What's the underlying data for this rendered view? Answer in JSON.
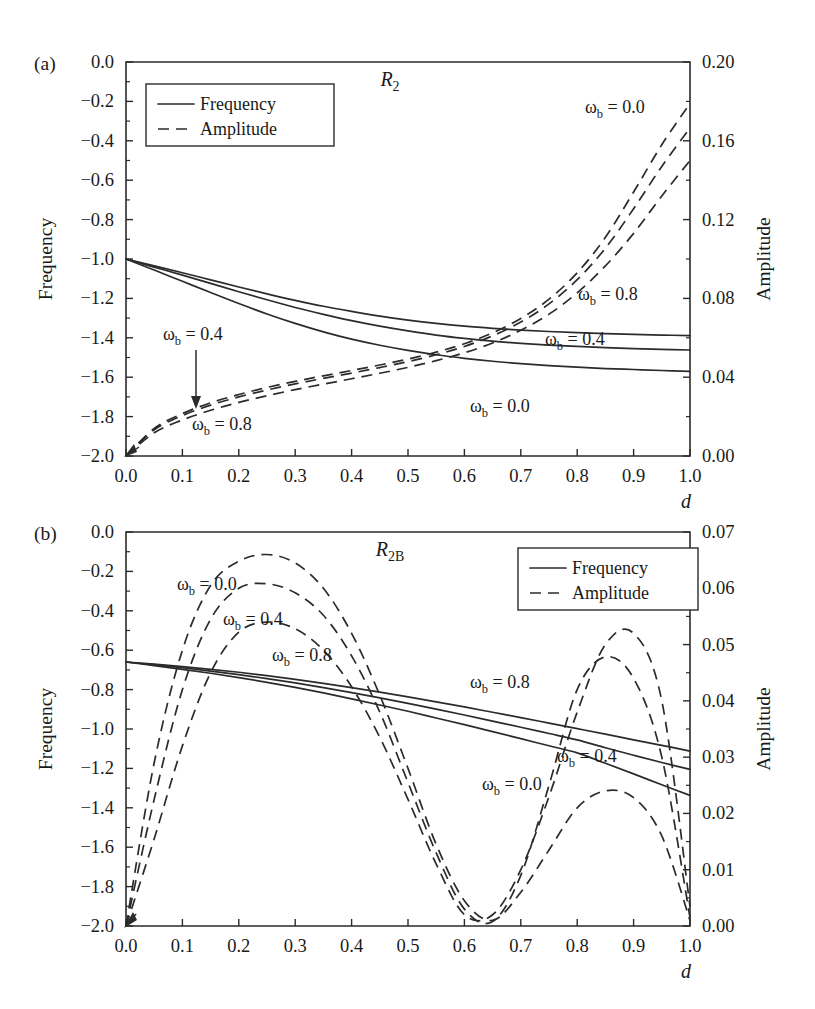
{
  "figure": {
    "panels": [
      {
        "id": "a",
        "panel_label": "(a)",
        "title_main": "R",
        "title_sub": "2",
        "xlabel": "d",
        "ylabel_left": "Frequency",
        "ylabel_right": "Amplitude",
        "legend": {
          "frequency": "Frequency",
          "amplitude": "Amplitude"
        },
        "xticks": [
          "0.0",
          "0.1",
          "0.2",
          "0.3",
          "0.4",
          "0.5",
          "0.6",
          "0.7",
          "0.8",
          "0.9",
          "1.0"
        ],
        "yticks_left": [
          "0.0",
          "-0.2",
          "-0.4",
          "-0.6",
          "-0.8",
          "-1.0",
          "-1.2",
          "-1.4",
          "-1.6",
          "-1.8",
          "-2.0"
        ],
        "yticks_right": [
          "0.20",
          "0.16",
          "0.12",
          "0.08",
          "0.04",
          "0.00"
        ],
        "annotations": [
          {
            "name": "freq-omega-08",
            "text": "ω",
            "sub": "b",
            "rest": " = 0.8"
          },
          {
            "name": "freq-omega-04",
            "text": "ω",
            "sub": "b",
            "rest": " = 0.4"
          },
          {
            "name": "freq-omega-00",
            "text": "ω",
            "sub": "b",
            "rest": " = 0.0"
          },
          {
            "name": "amp-omega-00",
            "text": "ω",
            "sub": "b",
            "rest": " = 0.0"
          },
          {
            "name": "amp-omega-04",
            "text": "ω",
            "sub": "b",
            "rest": " = 0.4"
          },
          {
            "name": "amp-omega-08",
            "text": "ω",
            "sub": "b",
            "rest": " = 0.8"
          }
        ]
      },
      {
        "id": "b",
        "panel_label": "(b)",
        "title_main": "R",
        "title_sub": "2B",
        "xlabel": "d",
        "ylabel_left": "Frequency",
        "ylabel_right": "Amplitude",
        "legend": {
          "frequency": "Frequency",
          "amplitude": "Amplitude"
        },
        "xticks": [
          "0.0",
          "0.1",
          "0.2",
          "0.3",
          "0.4",
          "0.5",
          "0.6",
          "0.7",
          "0.8",
          "0.9",
          "1.0"
        ],
        "yticks_left": [
          "0.0",
          "-0.2",
          "-0.4",
          "-0.6",
          "-0.8",
          "-1.0",
          "-1.2",
          "-1.4",
          "-1.6",
          "-1.8",
          "-2.0"
        ],
        "yticks_right": [
          "0.07",
          "0.06",
          "0.05",
          "0.04",
          "0.03",
          "0.02",
          "0.01",
          "0.00"
        ],
        "annotations": [
          {
            "name": "amp-omega-00",
            "text": "ω",
            "sub": "b",
            "rest": " = 0.0"
          },
          {
            "name": "amp-omega-04",
            "text": "ω",
            "sub": "b",
            "rest": " = 0.4"
          },
          {
            "name": "amp-omega-08",
            "text": "ω",
            "sub": "b",
            "rest": " = 0.8"
          },
          {
            "name": "freq-omega-08",
            "text": "ω",
            "sub": "b",
            "rest": " = 0.8"
          },
          {
            "name": "freq-omega-04",
            "text": "ω",
            "sub": "b",
            "rest": " = 0.4"
          },
          {
            "name": "freq-omega-00",
            "text": "ω",
            "sub": "b",
            "rest": " = 0.0"
          }
        ]
      }
    ]
  },
  "chart_data": [
    {
      "type": "line",
      "panel": "a",
      "title": "R2",
      "xlabel": "d",
      "ylabel_left": "Frequency",
      "ylabel_right": "Amplitude",
      "xlim": [
        0.0,
        1.0
      ],
      "ylim_left": [
        -2.0,
        0.0
      ],
      "ylim_right": [
        0.0,
        0.2
      ],
      "grid": false,
      "legend_position": "upper-left",
      "legend_entries": [
        "Frequency",
        "Amplitude"
      ],
      "x": [
        0.0,
        0.05,
        0.1,
        0.15,
        0.2,
        0.25,
        0.3,
        0.35,
        0.4,
        0.45,
        0.5,
        0.55,
        0.6,
        0.65,
        0.7,
        0.75,
        0.8,
        0.85,
        0.9,
        0.95,
        1.0
      ],
      "series": [
        {
          "name": "Frequency, ωb = 0.0",
          "axis": "left",
          "style": "solid",
          "values": [
            -1.0,
            -1.035,
            -1.07,
            -1.106,
            -1.142,
            -1.177,
            -1.21,
            -1.24,
            -1.266,
            -1.29,
            -1.31,
            -1.327,
            -1.341,
            -1.352,
            -1.361,
            -1.368,
            -1.374,
            -1.379,
            -1.383,
            -1.386,
            -1.389
          ]
        },
        {
          "name": "Frequency, ωb = 0.4",
          "axis": "left",
          "style": "solid",
          "values": [
            -1.0,
            -1.041,
            -1.082,
            -1.124,
            -1.166,
            -1.207,
            -1.246,
            -1.281,
            -1.313,
            -1.341,
            -1.365,
            -1.386,
            -1.403,
            -1.417,
            -1.428,
            -1.437,
            -1.444,
            -1.45,
            -1.455,
            -1.459,
            -1.462
          ]
        },
        {
          "name": "Frequency, ωb = 0.8",
          "axis": "left",
          "style": "solid",
          "values": [
            -1.0,
            -1.056,
            -1.113,
            -1.17,
            -1.226,
            -1.279,
            -1.327,
            -1.37,
            -1.407,
            -1.438,
            -1.464,
            -1.486,
            -1.504,
            -1.519,
            -1.531,
            -1.541,
            -1.549,
            -1.556,
            -1.561,
            -1.566,
            -1.57
          ]
        },
        {
          "name": "Amplitude, ωb = 0.0",
          "axis": "right",
          "style": "dashed",
          "values": [
            0.0,
            0.014,
            0.0215,
            0.027,
            0.0312,
            0.0348,
            0.0379,
            0.0407,
            0.0434,
            0.0462,
            0.0492,
            0.0527,
            0.057,
            0.0625,
            0.0698,
            0.0796,
            0.093,
            0.111,
            0.134,
            0.158,
            0.179
          ]
        },
        {
          "name": "Amplitude, ωb = 0.4",
          "axis": "right",
          "style": "dashed",
          "values": [
            0.0,
            0.0133,
            0.0205,
            0.0258,
            0.03,
            0.0335,
            0.0366,
            0.0394,
            0.0421,
            0.0449,
            0.0479,
            0.0514,
            0.0556,
            0.061,
            0.068,
            0.0772,
            0.0895,
            0.1055,
            0.1255,
            0.147,
            0.1665
          ]
        },
        {
          "name": "Amplitude, ωb = 0.8",
          "axis": "right",
          "style": "dashed",
          "values": [
            0.0,
            0.0118,
            0.0183,
            0.0232,
            0.0272,
            0.0306,
            0.0337,
            0.0365,
            0.0392,
            0.042,
            0.045,
            0.0484,
            0.0524,
            0.0574,
            0.0638,
            0.072,
            0.0828,
            0.0965,
            0.113,
            0.132,
            0.15
          ]
        }
      ]
    },
    {
      "type": "line",
      "panel": "b",
      "title": "R2B",
      "xlabel": "d",
      "ylabel_left": "Frequency",
      "ylabel_right": "Amplitude",
      "xlim": [
        0.0,
        1.0
      ],
      "ylim_left": [
        -2.0,
        0.0
      ],
      "ylim_right": [
        0.0,
        0.07
      ],
      "grid": false,
      "legend_position": "upper-right",
      "legend_entries": [
        "Frequency",
        "Amplitude"
      ],
      "x": [
        0.0,
        0.05,
        0.1,
        0.15,
        0.2,
        0.25,
        0.3,
        0.35,
        0.4,
        0.45,
        0.5,
        0.55,
        0.6,
        0.65,
        0.7,
        0.75,
        0.8,
        0.85,
        0.9,
        0.95,
        1.0
      ],
      "series": [
        {
          "name": "Frequency, ωb = 0.0",
          "axis": "left",
          "style": "solid",
          "values": [
            -0.66,
            -0.678,
            -0.697,
            -0.717,
            -0.739,
            -0.763,
            -0.789,
            -0.817,
            -0.847,
            -0.878,
            -0.91,
            -0.944,
            -0.978,
            -1.013,
            -1.049,
            -1.085,
            -1.121,
            -1.174,
            -1.228,
            -1.283,
            -1.337
          ]
        },
        {
          "name": "Frequency, ωb = 0.4",
          "axis": "left",
          "style": "solid",
          "values": [
            -0.66,
            -0.674,
            -0.689,
            -0.706,
            -0.724,
            -0.744,
            -0.766,
            -0.79,
            -0.815,
            -0.842,
            -0.87,
            -0.899,
            -0.929,
            -0.96,
            -0.991,
            -1.023,
            -1.055,
            -1.095,
            -1.133,
            -1.17,
            -1.205
          ]
        },
        {
          "name": "Frequency, ωb = 0.8",
          "axis": "left",
          "style": "solid",
          "values": [
            -0.66,
            -0.671,
            -0.683,
            -0.697,
            -0.712,
            -0.729,
            -0.748,
            -0.768,
            -0.79,
            -0.813,
            -0.837,
            -0.862,
            -0.888,
            -0.915,
            -0.942,
            -0.97,
            -0.998,
            -1.026,
            -1.055,
            -1.083,
            -1.112
          ]
        },
        {
          "name": "Amplitude, ωb = 0.0",
          "axis": "right",
          "style": "dashed",
          "values": [
            0.0,
            0.029,
            0.049,
            0.0605,
            0.0648,
            0.066,
            0.0645,
            0.06,
            0.052,
            0.041,
            0.028,
            0.0145,
            0.0045,
            0.001,
            0.006,
            0.0135,
            0.021,
            0.024,
            0.0228,
            0.016,
            0.001
          ]
        },
        {
          "name": "Amplitude, ωb = 0.4",
          "axis": "right",
          "style": "dashed",
          "values": [
            0.0,
            0.0225,
            0.042,
            0.0545,
            0.06,
            0.0608,
            0.0592,
            0.0552,
            0.048,
            0.038,
            0.0255,
            0.013,
            0.003,
            0.0008,
            0.009,
            0.025,
            0.042,
            0.0478,
            0.044,
            0.03,
            0.0015
          ]
        },
        {
          "name": "Amplitude, ωb = 0.8",
          "axis": "right",
          "style": "dashed",
          "values": [
            0.0,
            0.0155,
            0.032,
            0.045,
            0.0522,
            0.054,
            0.0528,
            0.049,
            0.0425,
            0.0335,
            0.0225,
            0.011,
            0.002,
            0.002,
            0.01,
            0.023,
            0.038,
            0.05,
            0.052,
            0.04,
            0.0035
          ]
        }
      ]
    }
  ]
}
